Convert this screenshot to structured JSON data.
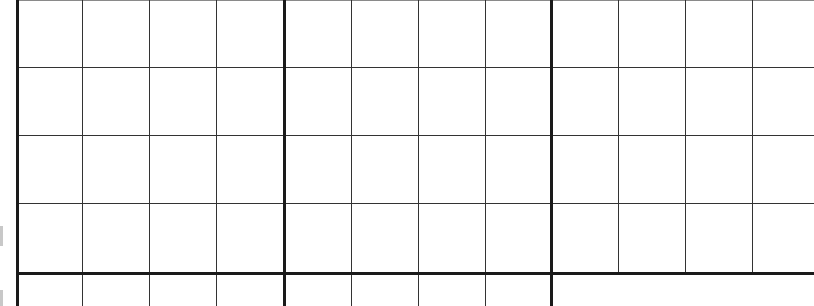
{
  "grid": {
    "background": "#ffffff",
    "line_color": "#1a1a1a",
    "thin_line_color": "#333333",
    "faint_line_color": "#8a8a8a",
    "cell_width": 67,
    "cell_height": 68,
    "thick_verticals": [
      17,
      284,
      551
    ],
    "thin_verticals_full": [
      82,
      149,
      216,
      351,
      418,
      485
    ],
    "thin_verticals_upper_only": [
      618,
      685,
      752
    ],
    "thin_horizontals": [
      67,
      135,
      203
    ],
    "faint_top_line": 0,
    "thick_horizontals": [
      273
    ],
    "upper_region_bottom": 273,
    "height": 306,
    "width": 814
  }
}
